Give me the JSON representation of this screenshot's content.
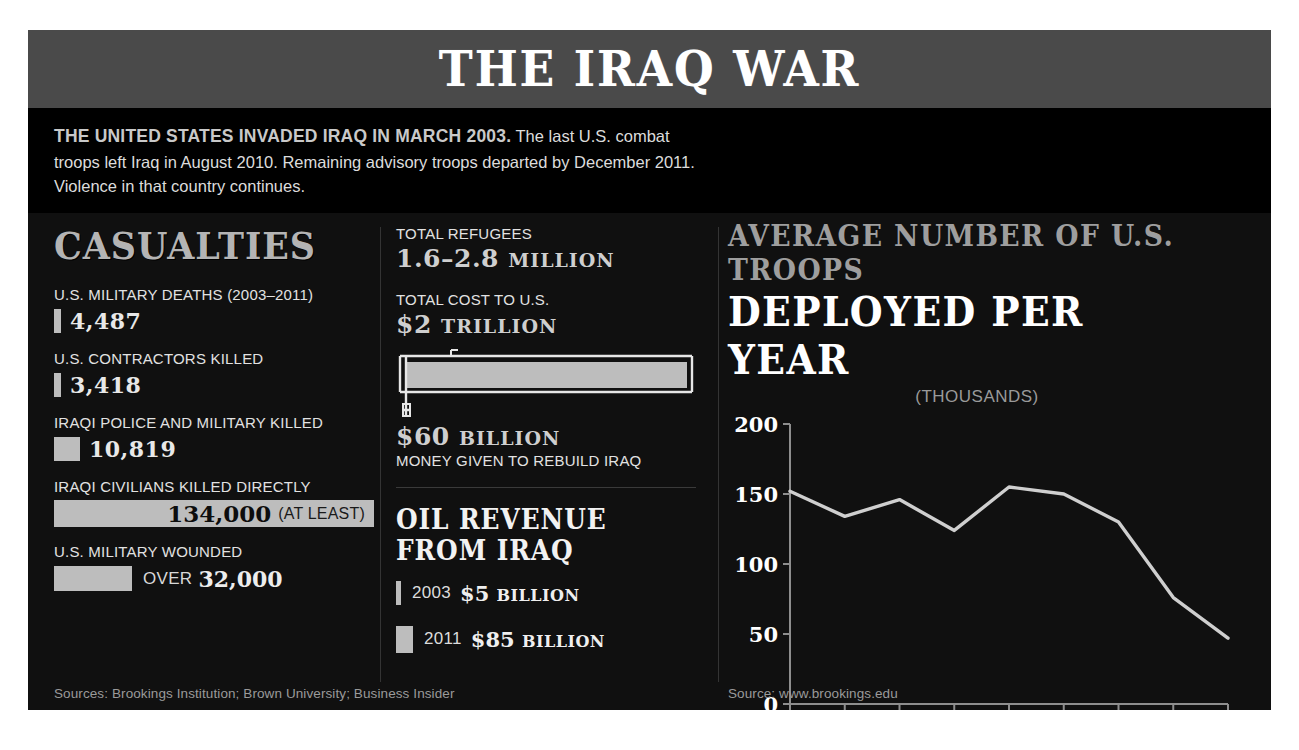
{
  "header": {
    "title": "THE IRAQ WAR"
  },
  "intro": {
    "lead": "THE UNITED STATES INVADED IRAQ IN MARCH 2003.",
    "body": " The last U.S. combat troops left Iraq in August 2010. Remaining advisory troops departed by December 2011. Violence in that country continues."
  },
  "casualties": {
    "title": "CASUALTIES",
    "items": [
      {
        "label": "U.S. MILITARY DEATHS (2003–2011)",
        "value": "4,487",
        "bar_px": 7,
        "style": "thin"
      },
      {
        "label": "U.S. CONTRACTORS KILLED",
        "value": "3,418",
        "bar_px": 7,
        "style": "thin"
      },
      {
        "label": "IRAQI POLICE AND MILITARY KILLED",
        "value": "10,819",
        "bar_px": 26,
        "style": "thin"
      },
      {
        "label": "IRAQI CIVILIANS KILLED DIRECTLY",
        "value": "134,000",
        "note": "(AT LEAST)",
        "bar_px": 320,
        "style": "wide"
      },
      {
        "label": "U.S. MILITARY WOUNDED",
        "value": "32,000",
        "note": "OVER",
        "bar_px": 78,
        "style": "over"
      }
    ]
  },
  "middle": {
    "refugees_label": "TOTAL REFUGEES",
    "refugees_value": "1.6–2.8",
    "refugees_unit": "MILLION",
    "cost_label": "TOTAL COST TO U.S.",
    "cost_value": "$2",
    "cost_unit": "TRILLION",
    "rebuild_value": "$60",
    "rebuild_unit": "BILLION",
    "rebuild_label": "MONEY GIVEN TO REBUILD IRAQ",
    "oil_title": "OIL REVENUE FROM IRAQ",
    "oil": [
      {
        "year": "2003",
        "amount": "$5",
        "unit": "BILLION",
        "bar_px": 5
      },
      {
        "year": "2011",
        "amount": "$85",
        "unit": "BILLION",
        "bar_px": 17
      }
    ]
  },
  "sources": {
    "left": "Sources: Brookings Institution; Brown University; Business Insider",
    "right": "Source: www.brookings.edu"
  },
  "colors": {
    "header_band": "#4a4a4a",
    "panel": "#101010",
    "bar": "#bdbdbd",
    "line": "#cfcfcf",
    "text_bright": "#ffffff",
    "text_dim": "#9e9e9e"
  },
  "chart_data": {
    "type": "line",
    "title": "AVERAGE NUMBER OF U.S. TROOPS",
    "title_2": "DEPLOYED PER YEAR",
    "subtitle": "(THOUSANDS)",
    "xlabel": "Year",
    "ylabel": "",
    "categories": [
      "2003",
      "2004",
      "2005",
      "2006",
      "2007",
      "2008",
      "2009",
      "2010",
      "2011"
    ],
    "values": [
      152,
      134,
      146,
      124,
      155,
      150,
      130,
      76,
      47
    ],
    "ylim": [
      0,
      200
    ],
    "yticks": [
      0,
      50,
      100,
      150,
      200
    ],
    "grid": false,
    "legend": "none",
    "series": [
      {
        "name": "U.S. troops deployed (thousands)",
        "values": [
          152,
          134,
          146,
          124,
          155,
          150,
          130,
          76,
          47
        ]
      }
    ]
  }
}
